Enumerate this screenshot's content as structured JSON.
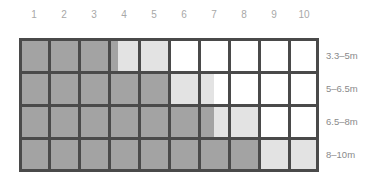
{
  "chart_data": {
    "type": "heatmap",
    "title": "",
    "xlabel": "",
    "ylabel": "",
    "columns": [
      "1",
      "2",
      "3",
      "4",
      "5",
      "6",
      "7",
      "8",
      "9",
      "10"
    ],
    "rows": [
      "3.3–5m",
      "5–6.5m",
      "6.5–8m",
      "8–10m"
    ],
    "series": [
      {
        "name": "3.3–5m",
        "dark_end": 3.3,
        "light_end": 5.0
      },
      {
        "name": "5–6.5m",
        "dark_end": 5.0,
        "light_end": 6.5
      },
      {
        "name": "6.5–8m",
        "dark_end": 6.5,
        "light_end": 8.0
      },
      {
        "name": "8–10m",
        "dark_end": 8.0,
        "light_end": 10.0
      }
    ],
    "xlim": [
      0,
      10
    ],
    "colors": {
      "dark": "#a3a3a3",
      "light": "#e3e3e3",
      "empty": "#ffffff",
      "grid": "#4a4a4a"
    },
    "grid": true
  }
}
